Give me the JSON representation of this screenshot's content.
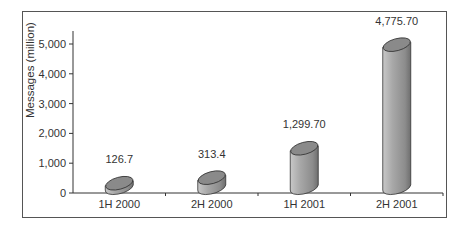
{
  "chart_data": {
    "type": "bar",
    "style": "3d-cylinder",
    "title": "",
    "xlabel": "",
    "ylabel": "Messages (million)",
    "categories": [
      "1H 2000",
      "2H 2000",
      "1H 2001",
      "2H 2001"
    ],
    "values": [
      126.7,
      313.4,
      1299.7,
      4775.7
    ],
    "value_labels": [
      "126.7",
      "313.4",
      "1,299.70",
      "4,775.70"
    ],
    "ylim": [
      0,
      5500
    ],
    "yticks": [
      0,
      1000,
      2000,
      3000,
      4000,
      5000
    ],
    "ytick_labels": [
      "0",
      "1,000",
      "2,000",
      "3,000",
      "4,000",
      "5,000"
    ],
    "grid": false,
    "legend": null,
    "colors": {
      "bar": "#9a9a9a",
      "bar_top": "#8a8a8a",
      "axis": "#333333",
      "frame": "#555555"
    }
  }
}
